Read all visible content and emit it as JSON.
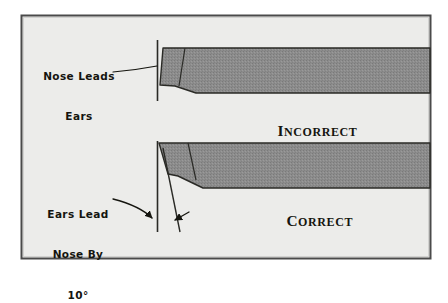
{
  "figure": {
    "frame": {
      "background_color": "#ececea",
      "border_color": "#4a4a4a",
      "page_color": "#ffffff"
    },
    "colors": {
      "fill_gray": "#8c8c8c",
      "ink": "#15150f",
      "outline": "#2a2a26"
    },
    "annotations": {
      "upper_label_line1": "Nose Leads",
      "upper_label_line2": "Ears",
      "lower_label_line1": "Ears Lead",
      "lower_label_line2": "Nose By",
      "lower_label_line3": "10°"
    },
    "captions": {
      "upper": "Incorrect",
      "upper_initial": "I",
      "upper_rest": "NCORRECT",
      "lower": "Correct",
      "lower_initial": "C",
      "lower_rest": "ORRECT"
    },
    "measurements": {
      "angle_value": "10",
      "angle_unit": "°"
    }
  }
}
